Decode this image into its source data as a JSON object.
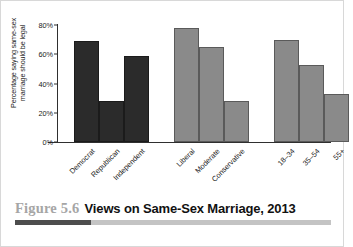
{
  "chart_data": {
    "type": "bar",
    "title": "Views on Same-Sex Marriage, 2013",
    "xlabel": "",
    "ylabel": "Percentage saying same-sex\nmarriage should be legal",
    "ylim": [
      0,
      80
    ],
    "yticks": [
      0,
      20,
      40,
      60,
      80
    ],
    "ytick_labels": [
      "0%",
      "20%",
      "40%",
      "60%",
      "80%"
    ],
    "grid": false,
    "legend": "none",
    "categories": [
      "Democrat",
      "Republican",
      "Independent",
      "Liberal",
      "Moderate",
      "Conservative",
      "18–34",
      "35–54",
      "55+"
    ],
    "values": [
      69,
      28,
      59,
      78,
      65,
      28,
      70,
      53,
      33
    ],
    "groups": [
      {
        "name": "party",
        "color": "#2b2b2b",
        "bars": [
          {
            "label": "Democrat",
            "value": 69
          },
          {
            "label": "Republican",
            "value": 28
          },
          {
            "label": "Independent",
            "value": 59
          }
        ]
      },
      {
        "name": "ideology",
        "color": "#8a8a8a",
        "bars": [
          {
            "label": "Liberal",
            "value": 78
          },
          {
            "label": "Moderate",
            "value": 65
          },
          {
            "label": "Conservative",
            "value": 28
          }
        ]
      },
      {
        "name": "age",
        "color": "#8a8a8a",
        "bars": [
          {
            "label": "18–34",
            "value": 70
          },
          {
            "label": "35–54",
            "value": 53
          },
          {
            "label": "55+",
            "value": 33
          }
        ]
      }
    ]
  },
  "caption": {
    "figure_number": "Figure 5.6",
    "title": "Views on Same-Sex Marriage, 2013"
  },
  "colors": {
    "bar_dark": "#2b2b2b",
    "bar_gray": "#8a8a8a",
    "axis": "#2f2f2f",
    "caption_number": "#a6a6a6",
    "accent_dark": "#4d4d4d",
    "accent_light": "#c4c4c4"
  }
}
